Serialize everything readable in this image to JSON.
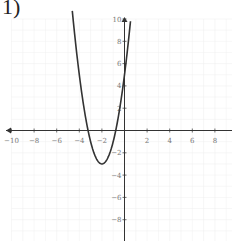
{
  "problem": {
    "label": "1)"
  },
  "chart_data": {
    "type": "line",
    "title": "",
    "xlabel": "",
    "ylabel": "",
    "xlim": [
      -10,
      10
    ],
    "ylim": [
      -10,
      10
    ],
    "grid": true,
    "x_ticks": [
      -10,
      -8,
      -6,
      -4,
      -2,
      2,
      4,
      6,
      8
    ],
    "y_ticks": [
      -8,
      -6,
      -4,
      -2,
      2,
      4,
      6,
      8,
      10
    ],
    "series": [
      {
        "name": "parabola",
        "equation": "y = 2(x + 2)^2 - 3",
        "vertex": [
          -2,
          -3
        ],
        "y_intercept": 5,
        "x_intercepts": [
          -3.22,
          -0.78
        ],
        "x": [
          -4.6,
          -4,
          -3.5,
          -3,
          -2.5,
          -2,
          -1.5,
          -1,
          -0.5,
          0,
          0.5
        ],
        "y": [
          10.52,
          5,
          1.5,
          -1,
          -2.5,
          -3,
          -2.5,
          -1,
          1.5,
          5,
          9.5
        ]
      }
    ],
    "colors": {
      "curve": "#333333",
      "axis": "#333333",
      "grid": "#eeeeee",
      "tick_label": "#777777"
    }
  }
}
